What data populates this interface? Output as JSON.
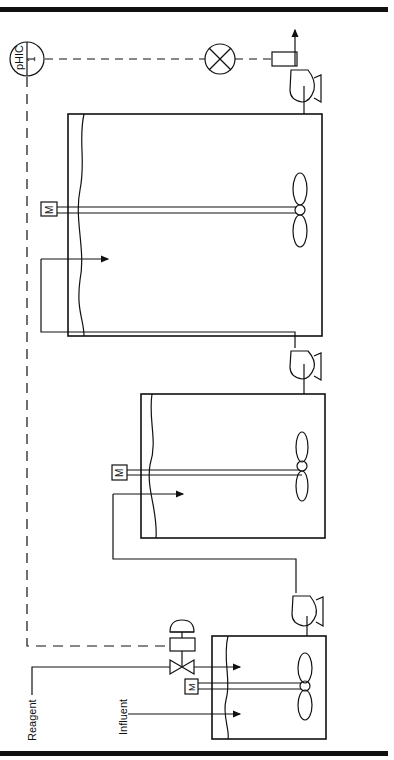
{
  "diagram": {
    "type": "process-flow",
    "controller": {
      "tag": "pHIC",
      "loop": "1"
    },
    "labels": {
      "reagent": "Reagent",
      "influent": "Influent"
    },
    "motor_label": "M",
    "tanks": [
      {
        "id": "tank-1",
        "role": "first neutralization tank"
      },
      {
        "id": "tank-2",
        "role": "second neutralization tank"
      },
      {
        "id": "tank-3",
        "role": "third neutralization tank"
      }
    ],
    "colors": {
      "line": "#111111",
      "background": "#ffffff"
    }
  }
}
